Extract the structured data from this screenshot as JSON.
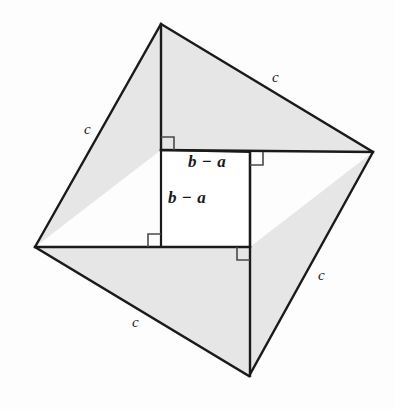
{
  "figure": {
    "name": "pythagorean-theorem-rearrangement-proof",
    "canvas": {
      "width": 395,
      "height": 409
    },
    "colors": {
      "page_background": "#fdfdfd",
      "triangle_fill": "#e6e6e6",
      "inner_square_fill": "#ffffff",
      "stroke": "#1a1a1a",
      "label_color": "#1a1a1a"
    },
    "outer_square": {
      "label": "outer-square-side-c",
      "vertices": [
        {
          "name": "top",
          "x": 161,
          "y": 24
        },
        {
          "name": "right",
          "x": 373,
          "y": 152
        },
        {
          "name": "bottom",
          "x": 249,
          "y": 376
        },
        {
          "name": "left",
          "x": 35,
          "y": 247
        }
      ]
    },
    "inner_square": {
      "label": "inner-square-side-b-minus-a",
      "vertices": [
        {
          "name": "top-left",
          "x": 161,
          "y": 150
        },
        {
          "name": "top-right",
          "x": 250,
          "y": 152
        },
        {
          "name": "bottom-right",
          "x": 250,
          "y": 247
        },
        {
          "name": "bottom-left",
          "x": 161,
          "y": 247
        }
      ]
    },
    "triangles": [
      {
        "name": "triangle-top",
        "points": "161,24 373,152 250,152 161,150"
      },
      {
        "name": "triangle-right",
        "points": "373,152 249,376 250,247"
      },
      {
        "name": "triangle-bottom",
        "points": "249,376 35,247 161,247 250,247"
      },
      {
        "name": "triangle-left",
        "points": "35,247 161,24 161,150"
      }
    ],
    "labels": {
      "hypotenuse": "c",
      "inner_side": "b − a",
      "c_positions": [
        {
          "name": "c-label-top-right",
          "x": 272,
          "y": 70,
          "text": "c"
        },
        {
          "name": "c-label-top-left",
          "x": 84,
          "y": 122,
          "text": "c"
        },
        {
          "name": "c-label-bottom-right",
          "x": 318,
          "y": 268,
          "text": "c"
        },
        {
          "name": "c-label-bottom-left",
          "x": 132,
          "y": 315,
          "text": "c"
        }
      ],
      "ba_positions": [
        {
          "name": "ba-label-horizontal",
          "x": 188,
          "y": 153,
          "text": "b − a"
        },
        {
          "name": "ba-label-vertical",
          "x": 168,
          "y": 189,
          "text": "b − a"
        }
      ]
    },
    "right_angle_marks": [
      {
        "name": "right-angle-mark-top-left-outer",
        "path": "M 161 137 L 174 137 L 174 150"
      },
      {
        "name": "right-angle-mark-top-right-outer",
        "path": "M 250 165 L 263 165 L 263 152"
      },
      {
        "name": "right-angle-mark-bottom-left-outer",
        "path": "M 161 234 L 148 234 L 148 247"
      },
      {
        "name": "right-angle-mark-bottom-right-outer",
        "path": "M 250 260 L 237 260 L 237 247"
      }
    ]
  }
}
